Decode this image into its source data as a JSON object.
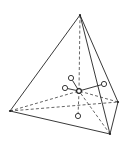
{
  "diagram": {
    "title": "",
    "colors": {
      "stroke": "#222222",
      "background": "#ffffff"
    },
    "vertices": {
      "apex": [
        80,
        15
      ],
      "left": [
        10,
        111
      ],
      "right": [
        118,
        102
      ],
      "bottom": [
        110,
        134
      ],
      "center": [
        79,
        91
      ]
    },
    "solid_edges": [
      [
        "apex",
        "left"
      ],
      [
        "apex",
        "bottom"
      ],
      [
        "apex",
        "right"
      ],
      [
        "left",
        "bottom"
      ],
      [
        "right",
        "bottom"
      ]
    ],
    "dashed_edges": [
      [
        "left",
        "right"
      ],
      [
        "apex",
        "center"
      ],
      [
        "left",
        "center"
      ],
      [
        "right",
        "center"
      ],
      [
        "bottom",
        "center"
      ],
      [
        "center",
        "c4"
      ]
    ],
    "circles": [
      {
        "id": "c1",
        "cx": 71,
        "cy": 78,
        "r": 2.6
      },
      {
        "id": "c2",
        "cx": 65,
        "cy": 88,
        "r": 2.6
      },
      {
        "id": "c3",
        "cx": 104,
        "cy": 84,
        "r": 2.6
      },
      {
        "id": "c4",
        "cx": 78,
        "cy": 116,
        "r": 2.6
      }
    ],
    "labels": []
  }
}
